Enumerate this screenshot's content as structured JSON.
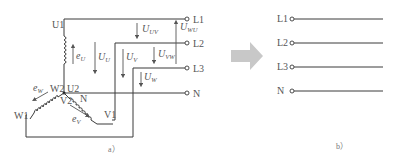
{
  "diagram_a": {
    "caption": "a）",
    "terminals": [
      "L1",
      "L2",
      "L3",
      "N"
    ],
    "winding_ends": {
      "u1": "U1",
      "u2": "U2",
      "v1": "V1",
      "v2": "V2",
      "w1": "W1",
      "w2": "W2",
      "n": "N"
    },
    "emf_labels": {
      "eu": "e",
      "eu_sub": "U",
      "ev": "e",
      "ev_sub": "V",
      "ew": "e",
      "ew_sub": "W"
    },
    "voltages": {
      "uu": "U",
      "uu_sub": "U",
      "uv": "U",
      "uv_sub": "V",
      "uw": "U",
      "uw_sub": "W",
      "uuv": "U",
      "uuv_sub": "UV",
      "uvw": "U",
      "uvw_sub": "VW",
      "uwu": "U",
      "uwu_sub": "WU"
    }
  },
  "arrow": {
    "color": "#c8c8c8"
  },
  "diagram_b": {
    "caption": "b）",
    "terminals": [
      "L1",
      "L2",
      "L3",
      "N"
    ]
  }
}
